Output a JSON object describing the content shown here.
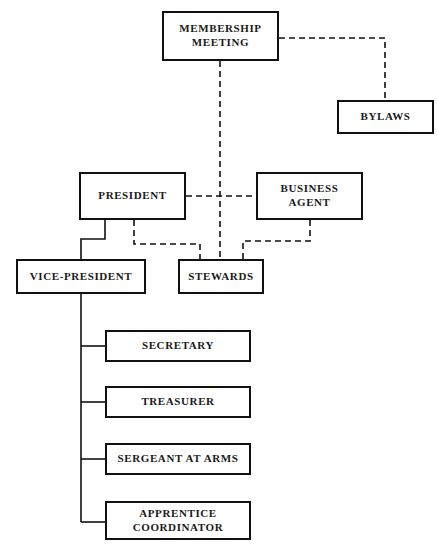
{
  "diagram": {
    "type": "org-chart",
    "background_color": "#ffffff",
    "line_color": "#111111",
    "box_border_color": "#111111",
    "nodes": [
      {
        "id": "membership-meeting",
        "label": "MEMBERSHIP\nMEETING"
      },
      {
        "id": "bylaws",
        "label": "BYLAWS"
      },
      {
        "id": "president",
        "label": "PRESIDENT"
      },
      {
        "id": "business-agent",
        "label": "BUSINESS\nAGENT"
      },
      {
        "id": "vice-president",
        "label": "VICE-PRESIDENT"
      },
      {
        "id": "stewards",
        "label": "STEWARDS"
      },
      {
        "id": "secretary",
        "label": "SECRETARY"
      },
      {
        "id": "treasurer",
        "label": "TREASURER"
      },
      {
        "id": "sergeant-at-arms",
        "label": "SERGEANT AT ARMS"
      },
      {
        "id": "apprentice-coordinator",
        "label": "APPRENTICE\nCOORDINATOR"
      }
    ],
    "connections": [
      {
        "from": "membership-meeting",
        "to": "bylaws",
        "style": "dashed"
      },
      {
        "from": "membership-meeting",
        "to": "stewards",
        "style": "dashed"
      },
      {
        "from": "president",
        "to": "business-agent",
        "style": "dashed"
      },
      {
        "from": "president",
        "to": "stewards",
        "style": "dashed"
      },
      {
        "from": "business-agent",
        "to": "stewards",
        "style": "dashed"
      },
      {
        "from": "president",
        "to": "vice-president",
        "style": "solid"
      },
      {
        "from": "vice-president",
        "to": "secretary",
        "style": "solid"
      },
      {
        "from": "vice-president",
        "to": "treasurer",
        "style": "solid"
      },
      {
        "from": "vice-president",
        "to": "sergeant-at-arms",
        "style": "solid"
      },
      {
        "from": "vice-president",
        "to": "apprentice-coordinator",
        "style": "solid"
      }
    ]
  }
}
